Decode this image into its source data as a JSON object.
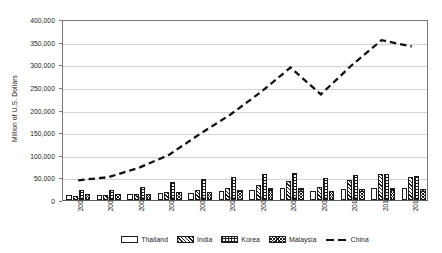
{
  "chart_data": {
    "type": "bar",
    "title": "",
    "subtitle": "",
    "xlabel": "",
    "ylabel": "Million of U.S. Dollars",
    "categories": [
      "2001",
      "2002",
      "2003",
      "2004",
      "2005",
      "2006",
      "2007",
      "2008",
      "2009",
      "2010",
      "2011",
      "2012"
    ],
    "ylim": [
      0,
      400000
    ],
    "ytick_values": [
      0,
      50000,
      100000,
      150000,
      200000,
      250000,
      300000,
      350000,
      400000
    ],
    "ytick_labels": [
      "0",
      "50,000",
      "100,000",
      "150,000",
      "200,000",
      "250,000",
      "300,000",
      "350,000",
      "400,000"
    ],
    "grid": true,
    "legend_position": "bottom",
    "series": [
      {
        "name": "Thailand",
        "kind": "bar",
        "pattern": "empty",
        "values": [
          11500,
          11500,
          13000,
          15500,
          16000,
          19500,
          23000,
          25500,
          20000,
          24500,
          27000,
          25500
        ]
      },
      {
        "name": "India",
        "kind": "bar",
        "pattern": "diagonal-hatch",
        "values": [
          9500,
          10500,
          12500,
          17000,
          23000,
          26000,
          33000,
          41000,
          28000,
          44500,
          57000,
          51500
        ]
      },
      {
        "name": "Korea",
        "kind": "bar",
        "pattern": "grid-hatch",
        "values": [
          22500,
          22000,
          28000,
          39500,
          45500,
          50500,
          57000,
          60000,
          48500,
          55000,
          58500,
          53000
        ]
      },
      {
        "name": "Malaysia",
        "kind": "bar",
        "pattern": "cross-hatch",
        "values": [
          13500,
          14000,
          14000,
          17000,
          18000,
          23000,
          25500,
          25500,
          19500,
          25000,
          27500,
          24500
        ]
      },
      {
        "name": "China",
        "kind": "line",
        "pattern": "dashed",
        "values": [
          44000,
          51000,
          72000,
          101000,
          147000,
          190000,
          240000,
          296000,
          236000,
          300000,
          357000,
          343000
        ]
      }
    ]
  },
  "legend": {
    "items": [
      {
        "label": "Thailand"
      },
      {
        "label": "India"
      },
      {
        "label": "Korea"
      },
      {
        "label": "Malaysia"
      },
      {
        "label": "China"
      }
    ]
  }
}
